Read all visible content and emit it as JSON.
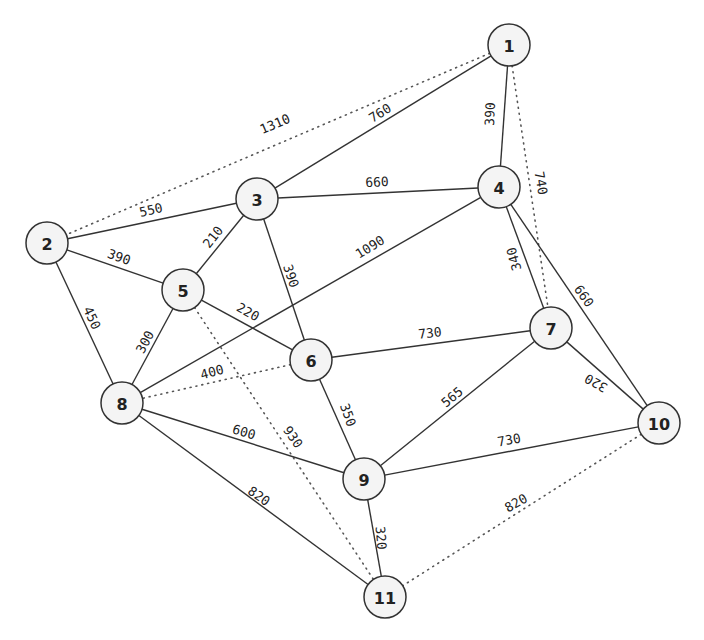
{
  "diagram": {
    "type": "weighted-undirected-graph",
    "colors": {
      "node_fill": "#f4f4f4",
      "stroke": "#333333",
      "text": "#222222",
      "background": "#ffffff"
    },
    "nodes": [
      {
        "id": "1",
        "label": "1",
        "x": 509,
        "y": 45
      },
      {
        "id": "2",
        "label": "2",
        "x": 47,
        "y": 243
      },
      {
        "id": "3",
        "label": "3",
        "x": 257,
        "y": 199
      },
      {
        "id": "4",
        "label": "4",
        "x": 499,
        "y": 187
      },
      {
        "id": "5",
        "label": "5",
        "x": 183,
        "y": 290
      },
      {
        "id": "6",
        "label": "6",
        "x": 311,
        "y": 360
      },
      {
        "id": "7",
        "label": "7",
        "x": 551,
        "y": 328
      },
      {
        "id": "8",
        "label": "8",
        "x": 122,
        "y": 403
      },
      {
        "id": "9",
        "label": "9",
        "x": 364,
        "y": 479
      },
      {
        "id": "10",
        "label": "10",
        "x": 659,
        "y": 423
      },
      {
        "id": "11",
        "label": "11",
        "x": 385,
        "y": 597
      }
    ],
    "edges": [
      {
        "from": "1",
        "to": "3",
        "weight": "760",
        "style": "solid",
        "lx": 380,
        "ly": 113,
        "angle": -32
      },
      {
        "from": "1",
        "to": "4",
        "weight": "390",
        "style": "solid",
        "lx": 490,
        "ly": 114,
        "angle": -88
      },
      {
        "from": "1",
        "to": "2",
        "weight": "1310",
        "style": "dotted",
        "lx": 275,
        "ly": 124,
        "angle": -23
      },
      {
        "from": "1",
        "to": "7",
        "weight": "740",
        "style": "dotted",
        "lx": 541,
        "ly": 183,
        "angle": 80
      },
      {
        "from": "2",
        "to": "3",
        "weight": "550",
        "style": "solid",
        "lx": 151,
        "ly": 210,
        "angle": -13
      },
      {
        "from": "2",
        "to": "5",
        "weight": "390",
        "style": "solid",
        "lx": 119,
        "ly": 257,
        "angle": 20
      },
      {
        "from": "2",
        "to": "8",
        "weight": "450",
        "style": "solid",
        "lx": 92,
        "ly": 318,
        "angle": 65
      },
      {
        "from": "3",
        "to": "4",
        "weight": "660",
        "style": "solid",
        "lx": 377,
        "ly": 182,
        "angle": -2
      },
      {
        "from": "3",
        "to": "5",
        "weight": "210",
        "style": "solid",
        "lx": 213,
        "ly": 237,
        "angle": -52
      },
      {
        "from": "3",
        "to": "6",
        "weight": "390",
        "style": "solid",
        "lx": 291,
        "ly": 276,
        "angle": 72
      },
      {
        "from": "4",
        "to": "8",
        "weight": "1090",
        "style": "solid",
        "lx": 370,
        "ly": 247,
        "angle": -32
      },
      {
        "from": "4",
        "to": "7",
        "weight": "340",
        "style": "solid",
        "lx": 514,
        "ly": 259,
        "angle": -105
      },
      {
        "from": "4",
        "to": "10",
        "weight": "660",
        "style": "solid",
        "lx": 584,
        "ly": 296,
        "angle": 55
      },
      {
        "from": "5",
        "to": "6",
        "weight": "220",
        "style": "solid",
        "lx": 248,
        "ly": 312,
        "angle": 30
      },
      {
        "from": "5",
        "to": "8",
        "weight": "300",
        "style": "solid",
        "lx": 145,
        "ly": 342,
        "angle": -62
      },
      {
        "from": "5",
        "to": "11",
        "weight": "930",
        "style": "dotted",
        "lx": 293,
        "ly": 437,
        "angle": 55
      },
      {
        "from": "6",
        "to": "7",
        "weight": "730",
        "style": "solid",
        "lx": 430,
        "ly": 333,
        "angle": -6
      },
      {
        "from": "6",
        "to": "8",
        "weight": "400",
        "style": "dotted",
        "lx": 212,
        "ly": 372,
        "angle": -15
      },
      {
        "from": "6",
        "to": "9",
        "weight": "350",
        "style": "solid",
        "lx": 348,
        "ly": 415,
        "angle": 70
      },
      {
        "from": "7",
        "to": "9",
        "weight": "565",
        "style": "solid",
        "lx": 452,
        "ly": 397,
        "angle": -40
      },
      {
        "from": "7",
        "to": "10",
        "weight": "320",
        "style": "solid",
        "lx": 596,
        "ly": 383,
        "angle": 210
      },
      {
        "from": "8",
        "to": "9",
        "weight": "600",
        "style": "solid",
        "lx": 244,
        "ly": 432,
        "angle": 16
      },
      {
        "from": "8",
        "to": "11",
        "weight": "820",
        "style": "solid",
        "lx": 259,
        "ly": 496,
        "angle": 35
      },
      {
        "from": "9",
        "to": "10",
        "weight": "730",
        "style": "solid",
        "lx": 509,
        "ly": 440,
        "angle": -10
      },
      {
        "from": "9",
        "to": "11",
        "weight": "320",
        "style": "solid",
        "lx": 381,
        "ly": 538,
        "angle": 85
      },
      {
        "from": "10",
        "to": "11",
        "weight": "820",
        "style": "dotted",
        "lx": 516,
        "ly": 503,
        "angle": -30
      }
    ]
  }
}
